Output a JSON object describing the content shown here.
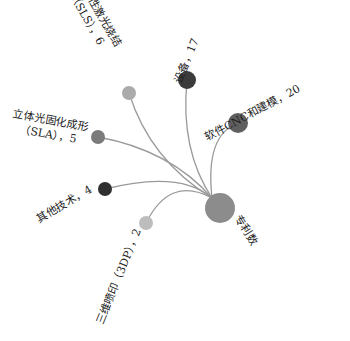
{
  "chart_data": {
    "type": "tree",
    "layout": "radial",
    "title": "",
    "root": {
      "name": "专利数",
      "label": "专利数",
      "x": 220,
      "y": 208,
      "r": 15,
      "color": "#8c8c8c",
      "label_x": 243,
      "label_y": 232,
      "label_rotate": 58
    },
    "children": [
      {
        "name": "选择性激光烧结（SLS）",
        "value": 6,
        "label_lines": [
          "选择性激光烧结",
          "（SLS），6"
        ],
        "x": 129,
        "y": 93,
        "r": 7,
        "color": "#ababab",
        "label_x": 96,
        "label_y": 14,
        "label_rotate": 60,
        "ctrl": [
          150,
          160
        ]
      },
      {
        "name": "设备",
        "value": 17,
        "label_lines": [
          "设备，17"
        ],
        "x": 187,
        "y": 80,
        "r": 9,
        "color": "#3b3b3b",
        "label_x": 190,
        "label_y": 62,
        "label_rotate": -68,
        "ctrl": [
          180,
          150
        ]
      },
      {
        "name": "软件CNC和建模",
        "value": 20,
        "label_lines": [
          "软件CNC和建模，20"
        ],
        "x": 238,
        "y": 123,
        "r": 10,
        "color": "#5f5f5f",
        "label_x": 254,
        "label_y": 116,
        "label_rotate": -28,
        "ctrl": [
          205,
          135
        ]
      },
      {
        "name": "立体光固化成形（SLA）",
        "value": 5,
        "label_lines": [
          "立体光固化成形",
          "（SLA），5"
        ],
        "x": 98,
        "y": 137,
        "r": 7,
        "color": "#7b7b7b",
        "label_x": 50,
        "label_y": 124,
        "label_rotate": 10,
        "ctrl": [
          170,
          150
        ]
      },
      {
        "name": "其他技术",
        "value": 4,
        "label_lines": [
          "其他技术，4"
        ],
        "x": 105,
        "y": 189,
        "r": 7,
        "color": "#2f2f2f",
        "label_x": 66,
        "label_y": 207,
        "label_rotate": -30,
        "ctrl": [
          180,
          170
        ]
      },
      {
        "name": "三维喷印（3DP）",
        "value": 2,
        "label_lines": [
          "三维喷印（3DP），2"
        ],
        "x": 146,
        "y": 223,
        "r": 7,
        "color": "#bdbdbd",
        "label_x": 122,
        "label_y": 278,
        "label_rotate": -68,
        "ctrl": [
          170,
          175
        ]
      }
    ],
    "edge_color": "#9a9a9a",
    "background": "#ffffff"
  }
}
